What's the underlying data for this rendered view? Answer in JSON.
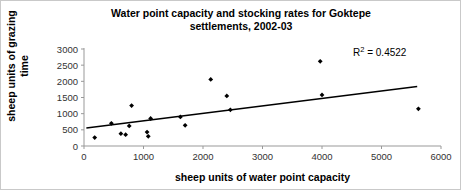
{
  "chart_data": {
    "type": "scatter",
    "title": "Water point capacity and stocking rates for Goktepe settlements, 2002-03",
    "title_line1": "Water point capacity and stocking rates for Goktepe",
    "title_line2": "settlements, 2002-03",
    "xlabel": "sheep units of water point capacity",
    "ylabel": "sheep units of grazing time",
    "xlim": [
      0,
      6000
    ],
    "ylim": [
      0,
      3000
    ],
    "xticks": [
      0,
      1000,
      2000,
      3000,
      4000,
      5000,
      6000
    ],
    "yticks": [
      0,
      500,
      1000,
      1500,
      2000,
      2500,
      3000
    ],
    "grid": false,
    "legend": false,
    "annotations": [
      {
        "name": "r-squared",
        "text_prefix": "R",
        "text_superscript": "2",
        "text_suffix": " = 0.4522",
        "value": 0.4522
      }
    ],
    "marker_color": "#000000",
    "marker_shape": "diamond",
    "points": [
      {
        "x": 180,
        "y": 260
      },
      {
        "x": 460,
        "y": 700
      },
      {
        "x": 620,
        "y": 380
      },
      {
        "x": 700,
        "y": 350
      },
      {
        "x": 760,
        "y": 620
      },
      {
        "x": 800,
        "y": 1250
      },
      {
        "x": 1060,
        "y": 430
      },
      {
        "x": 1080,
        "y": 300
      },
      {
        "x": 1120,
        "y": 850
      },
      {
        "x": 1620,
        "y": 900
      },
      {
        "x": 1700,
        "y": 640
      },
      {
        "x": 2130,
        "y": 2060
      },
      {
        "x": 2400,
        "y": 1550
      },
      {
        "x": 2460,
        "y": 1120
      },
      {
        "x": 3970,
        "y": 2620
      },
      {
        "x": 4000,
        "y": 1580
      },
      {
        "x": 5620,
        "y": 1150
      }
    ],
    "trendline": {
      "name": "linear-trendline",
      "x_start": 40,
      "y_start": 555,
      "x_end": 5600,
      "y_end": 1840,
      "color": "#000000"
    }
  }
}
